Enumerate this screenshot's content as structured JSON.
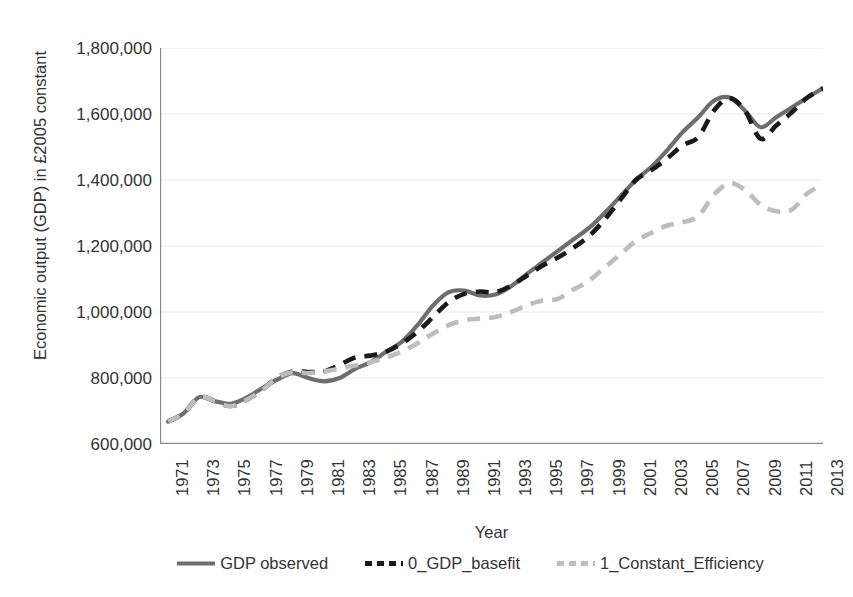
{
  "chart_data": {
    "type": "line",
    "title": "",
    "xlabel": "Year",
    "ylabel": "Economic output (GDP) in £2005 constant",
    "xlim": [
      1971,
      2013
    ],
    "ylim": [
      600000,
      1800000
    ],
    "ytick_interval": 200000,
    "grid": true,
    "legend_position": "bottom",
    "ytick_labels": [
      "1,800,000",
      "1,600,000",
      "1,400,000",
      "1,200,000",
      "1,000,000",
      "800,000",
      "600,000"
    ],
    "ytick_values": [
      1800000,
      1600000,
      1400000,
      1200000,
      1000000,
      800000,
      600000
    ],
    "xtick_labels": [
      "1971",
      "1973",
      "1975",
      "1977",
      "1979",
      "1981",
      "1983",
      "1985",
      "1987",
      "1989",
      "1991",
      "1993",
      "1995",
      "1997",
      "1999",
      "2001",
      "2003",
      "2005",
      "2007",
      "2009",
      "2011",
      "2013"
    ],
    "x": [
      1971,
      1972,
      1973,
      1974,
      1975,
      1976,
      1977,
      1978,
      1979,
      1980,
      1981,
      1982,
      1983,
      1984,
      1985,
      1986,
      1987,
      1988,
      1989,
      1990,
      1991,
      1992,
      1993,
      1994,
      1995,
      1996,
      1997,
      1998,
      1999,
      2000,
      2001,
      2002,
      2003,
      2004,
      2005,
      2006,
      2007,
      2008,
      2009,
      2010,
      2011,
      2012,
      2013
    ],
    "series": [
      {
        "name": "GDP observed",
        "color": "#6e6e6e",
        "style": "solid",
        "values": [
          668000,
          693000,
          742000,
          730000,
          722000,
          740000,
          768000,
          795000,
          815000,
          800000,
          790000,
          800000,
          828000,
          848000,
          880000,
          910000,
          960000,
          1020000,
          1060000,
          1065000,
          1050000,
          1053000,
          1078000,
          1115000,
          1150000,
          1185000,
          1220000,
          1255000,
          1300000,
          1350000,
          1400000,
          1440000,
          1490000,
          1545000,
          1590000,
          1640000,
          1650000,
          1610000,
          1560000,
          1590000,
          1620000,
          1650000,
          1678000
        ]
      },
      {
        "name": "0_GDP_basefit",
        "color": "#1a1a1a",
        "style": "dashed",
        "values": [
          668000,
          693000,
          742000,
          730000,
          715000,
          733000,
          763000,
          800000,
          820000,
          818000,
          820000,
          840000,
          862000,
          868000,
          880000,
          905000,
          940000,
          985000,
          1030000,
          1055000,
          1062000,
          1060000,
          1080000,
          1110000,
          1140000,
          1165000,
          1195000,
          1230000,
          1280000,
          1340000,
          1400000,
          1430000,
          1465000,
          1505000,
          1530000,
          1610000,
          1648000,
          1610000,
          1525000,
          1565000,
          1605000,
          1650000,
          1678000
        ]
      },
      {
        "name": "1_Constant_Efficiency",
        "color": "#bdbdbd",
        "style": "dashed",
        "values": [
          668000,
          693000,
          742000,
          730000,
          715000,
          733000,
          763000,
          800000,
          818000,
          815000,
          820000,
          828000,
          838000,
          848000,
          862000,
          880000,
          905000,
          935000,
          960000,
          975000,
          980000,
          985000,
          1000000,
          1020000,
          1035000,
          1040000,
          1068000,
          1095000,
          1135000,
          1175000,
          1215000,
          1240000,
          1262000,
          1272000,
          1290000,
          1355000,
          1390000,
          1370000,
          1325000,
          1305000,
          1310000,
          1360000,
          1385000
        ]
      }
    ]
  },
  "axis": {
    "x_title": "Year",
    "y_title": "Economic output (GDP) in £2005 constant"
  },
  "legend": {
    "items": [
      {
        "label": "GDP observed",
        "swatch": "solid-gray-line-icon"
      },
      {
        "label": "0_GDP_basefit",
        "swatch": "dashed-black-line-icon"
      },
      {
        "label": "1_Constant_Efficiency",
        "swatch": "dashed-lightgray-line-icon"
      }
    ]
  },
  "colors": {
    "observed": "#6e6e6e",
    "basefit": "#1a1a1a",
    "constant_efficiency": "#bdbdbd",
    "axis": "#808080",
    "grid": "#e8e8e8",
    "text": "#333333"
  }
}
